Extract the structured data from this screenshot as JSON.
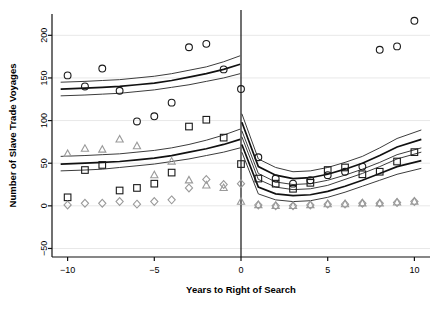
{
  "chart_data": {
    "type": "scatter",
    "title": "",
    "xlabel": "Years to Right of Search",
    "ylabel": "Number of Slave Trade Voyages",
    "xlim": [
      -10.9,
      10.9
    ],
    "ylim": [
      -60,
      225
    ],
    "xticks": [
      -10,
      -5,
      0,
      5,
      10
    ],
    "xtick_labels": [
      "−10",
      "−5",
      "0",
      "5",
      "10"
    ],
    "yticks": [
      -50,
      0,
      50,
      100,
      150,
      200
    ],
    "ytick_labels": [
      "−50",
      "0",
      "50",
      "100",
      "150",
      "200"
    ],
    "grid": "horizontal-light",
    "legend": "none",
    "vertical_reference_line": 0,
    "series": [
      {
        "name": "circles",
        "marker": "circle",
        "color": "#1a1a1a",
        "x": [
          -10,
          -9,
          -8,
          -7,
          -6,
          -5,
          -4,
          -3,
          -2,
          -1,
          0,
          1,
          2,
          3,
          4,
          5,
          6,
          7,
          8,
          9,
          10
        ],
        "y": [
          153,
          140,
          161,
          135,
          99,
          105,
          121,
          186,
          190,
          160,
          137,
          57,
          32,
          26,
          30,
          36,
          40,
          46,
          183,
          187,
          217
        ]
      },
      {
        "name": "squares",
        "marker": "square",
        "color": "#1a1a1a",
        "x": [
          -10,
          -9,
          -8,
          -7,
          -6,
          -5,
          -4,
          -3,
          -2,
          -1,
          0,
          1,
          2,
          3,
          4,
          5,
          6,
          7,
          8,
          9,
          10
        ],
        "y": [
          10,
          42,
          48,
          18,
          21,
          26,
          39,
          93,
          101,
          80,
          49,
          32,
          26,
          20,
          27,
          42,
          45,
          37,
          40,
          52,
          63
        ]
      },
      {
        "name": "triangles",
        "marker": "triangle",
        "color": "#9a9a9a",
        "x": [
          -10,
          -9,
          -8,
          -7,
          -6,
          -5,
          -4,
          -3,
          -2,
          -1,
          0,
          1,
          2,
          3,
          4,
          5,
          6,
          7,
          8,
          9,
          10
        ],
        "y": [
          61,
          67,
          66,
          78,
          70,
          36,
          52,
          30,
          24,
          21,
          5,
          1,
          0,
          0,
          1,
          2,
          2,
          3,
          3,
          4,
          5
        ]
      },
      {
        "name": "diamonds",
        "marker": "diamond",
        "color": "#9a9a9a",
        "x": [
          -10,
          -9,
          -8,
          -7,
          -6,
          -5,
          -4,
          -3,
          -2,
          -1,
          0,
          1,
          2,
          3,
          4,
          5,
          6,
          7,
          8,
          9,
          10
        ],
        "y": [
          1,
          3,
          3,
          5,
          2,
          5,
          7,
          21,
          31,
          25,
          26,
          1,
          0,
          0,
          1,
          2,
          2,
          3,
          3,
          4,
          5
        ]
      }
    ],
    "fitted_bands": [
      {
        "name": "upper-band-left",
        "side": "left",
        "x": [
          -10.4,
          -9,
          -8,
          -7,
          -6,
          -5,
          -4,
          -3,
          -2,
          -1,
          -0.05
        ],
        "fit": [
          137,
          138,
          139,
          140,
          142,
          144,
          147,
          151,
          155,
          160,
          166
        ],
        "lower": [
          129,
          130,
          131,
          132,
          134,
          136,
          139,
          142,
          146,
          150,
          155
        ],
        "upper": [
          145,
          146,
          147,
          148,
          150,
          152,
          155,
          159,
          163,
          169,
          176
        ]
      },
      {
        "name": "upper-band-right",
        "side": "right",
        "x": [
          0.05,
          1,
          2,
          3,
          4,
          5,
          6,
          7,
          8,
          9,
          10.4
        ],
        "fit": [
          98,
          46,
          36,
          32,
          33,
          37,
          43,
          50,
          59,
          69,
          78
        ],
        "lower": [
          88,
          38,
          28,
          25,
          26,
          30,
          36,
          43,
          51,
          60,
          68
        ],
        "upper": [
          108,
          55,
          45,
          40,
          41,
          45,
          51,
          58,
          68,
          79,
          89
        ]
      },
      {
        "name": "lower-band-left",
        "side": "left",
        "x": [
          -10.4,
          -9,
          -8,
          -7,
          -6,
          -5,
          -4,
          -3,
          -2,
          -1,
          -0.05
        ],
        "fit": [
          49,
          50,
          51,
          52,
          54,
          56,
          59,
          63,
          67,
          72,
          78
        ],
        "lower": [
          41,
          42,
          43,
          45,
          47,
          49,
          52,
          55,
          59,
          63,
          68
        ],
        "upper": [
          58,
          59,
          60,
          61,
          63,
          65,
          68,
          72,
          77,
          83,
          90
        ]
      },
      {
        "name": "lower-band-right",
        "side": "right",
        "x": [
          0.05,
          1,
          2,
          3,
          4,
          5,
          6,
          7,
          8,
          9,
          10.4
        ],
        "fit": [
          72,
          22,
          14,
          12,
          13,
          17,
          23,
          30,
          38,
          46,
          53
        ],
        "lower": [
          63,
          14,
          7,
          5,
          6,
          10,
          16,
          23,
          30,
          37,
          44
        ],
        "upper": [
          81,
          31,
          22,
          19,
          20,
          24,
          31,
          38,
          46,
          55,
          63
        ]
      }
    ]
  },
  "plot_geometry": {
    "left": 52,
    "right": 430,
    "top": 14,
    "bottom": 257
  }
}
